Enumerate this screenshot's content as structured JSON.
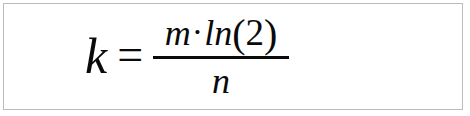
{
  "image": {
    "kind": "formula-image",
    "background_color": "#ffffff",
    "border_color": "#b9bcbe",
    "text_color": "#0a0a0a"
  },
  "formula": {
    "plain_text": "k = m·ln(2) / n",
    "left_side": {
      "variable": "k"
    },
    "relation": "=",
    "right_side": {
      "type": "fraction",
      "numerator": {
        "variable": "m",
        "operator": "·",
        "function": "ln",
        "open_paren": "(",
        "argument": "2",
        "close_paren": ")"
      },
      "denominator": {
        "variable": "n"
      }
    }
  }
}
